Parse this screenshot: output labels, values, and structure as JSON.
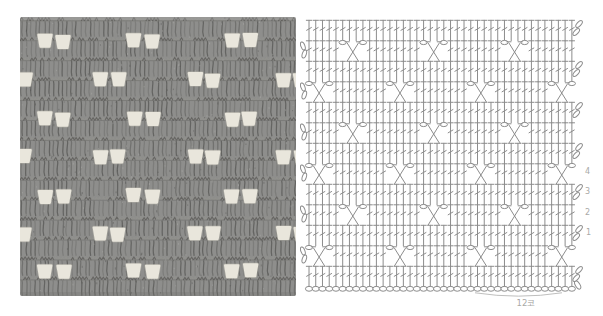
{
  "page": {
    "background_color": "#ffffff"
  },
  "photo": {
    "base_color": "#8e8e8c",
    "stitch_dark_color": "#5e5e5c",
    "stitch_mid_color": "#6d6d6b",
    "stitch_soft_color": "#7b7b79",
    "ridge_dark_color": "#63625e",
    "ridge_light_color": "#91918d",
    "speckle_light_color": "#b1b1af",
    "speckle_dark_color": "#4d4d4b",
    "hole_fill_color": "#e9e6dc",
    "hole_halo_color": "#bab8ae",
    "fabric_rows": 14,
    "pair_offset": 9.2,
    "hole_width": 13.4,
    "hole_height": 12,
    "hole_rows": [
      {
        "y": 41,
        "pair_centers": [
          54,
          143,
          241
        ]
      },
      {
        "y": 80,
        "pair_centers": [
          15,
          109,
          204,
          292
        ]
      },
      {
        "y": 119,
        "pair_centers": [
          54,
          143,
          241
        ]
      },
      {
        "y": 157,
        "pair_centers": [
          15,
          109,
          204,
          292
        ]
      },
      {
        "y": 196,
        "pair_centers": [
          54,
          143,
          241
        ]
      },
      {
        "y": 234,
        "pair_centers": [
          15,
          109,
          204,
          292
        ]
      },
      {
        "y": 271,
        "pair_centers": [
          54,
          143,
          241
        ]
      }
    ]
  },
  "chart": {
    "stroke_color": "#8c8c8c",
    "chain_fill_color": "#ffffff",
    "label_color": "#a9a9a7",
    "brace_color": "#b7b7b5",
    "columns": 40,
    "repeat_stitches": 12,
    "repeat_label": "12코",
    "row_types": [
      "dc",
      "cross-a",
      "dc",
      "cross-b",
      "dc",
      "cross-a",
      "dc",
      "cross-b",
      "dc",
      "cross-a",
      "dc",
      "cross-b",
      "dc"
    ],
    "cross_a_block_starts": [
      5,
      17,
      29
    ],
    "cross_b_block_starts": [
      0,
      12,
      24,
      36
    ],
    "row_labels": [
      {
        "row_index": 7,
        "label": "4"
      },
      {
        "row_index": 8,
        "label": "3"
      },
      {
        "row_index": 9,
        "label": "2"
      },
      {
        "row_index": 10,
        "label": "1"
      }
    ],
    "symbol_legend": {
      "dc": "double-crochet",
      "cross": "crossed-double-crochet",
      "oval": "chain-stitch",
      "foundation": "foundation-chain",
      "turn": "turning-chain"
    }
  }
}
